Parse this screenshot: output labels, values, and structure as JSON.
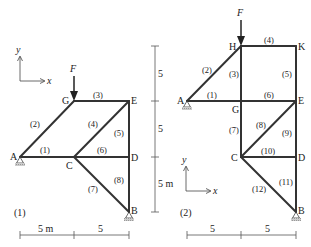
{
  "diagram1": {
    "id_label": "(1)",
    "force_label": "F",
    "axis": {
      "x": "x",
      "y": "y"
    },
    "nodes": {
      "A": "A",
      "B": "B",
      "C": "C",
      "D": "D",
      "E": "E",
      "G": "G"
    },
    "members": [
      "(1)",
      "(2)",
      "(3)",
      "(4)",
      "(5)",
      "(6)",
      "(7)",
      "(8)"
    ],
    "dims_vertical": [
      "5",
      "5",
      "5 m"
    ],
    "dims_horizontal": [
      "5 m",
      "5"
    ]
  },
  "diagram2": {
    "id_label": "(2)",
    "force_label": "F",
    "axis": {
      "x": "x",
      "y": "y"
    },
    "nodes": {
      "A": "A",
      "B": "B",
      "C": "C",
      "D": "D",
      "E": "E",
      "G": "G",
      "H": "H",
      "K": "K"
    },
    "members": [
      "(1)",
      "(2)",
      "(3)",
      "(4)",
      "(5)",
      "(6)",
      "(7)",
      "(8)",
      "(9)",
      "(10)",
      "(11)",
      "(12)"
    ],
    "dims_horizontal": [
      "5",
      "5"
    ]
  }
}
